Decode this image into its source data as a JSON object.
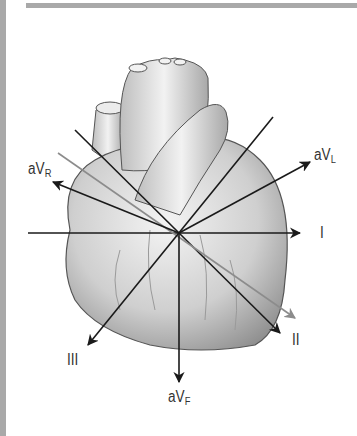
{
  "figure": {
    "center": [
      179,
      233
    ],
    "colors": {
      "axis": "#1a1a1a",
      "axis_alt": "#8c8c8c",
      "frame": "#a9a9a9"
    }
  },
  "leads": [
    {
      "id": "I",
      "label": "I",
      "sub": "",
      "angle_deg": 0
    },
    {
      "id": "II",
      "label": "II",
      "sub": "",
      "angle_deg": 60
    },
    {
      "id": "III",
      "label": "III",
      "sub": "",
      "angle_deg": 120
    },
    {
      "id": "aVR",
      "label": "aV",
      "sub": "R",
      "angle_deg": -150
    },
    {
      "id": "aVL",
      "label": "aV",
      "sub": "L",
      "angle_deg": -30
    },
    {
      "id": "aVF",
      "label": "aV",
      "sub": "F",
      "angle_deg": 90
    }
  ]
}
